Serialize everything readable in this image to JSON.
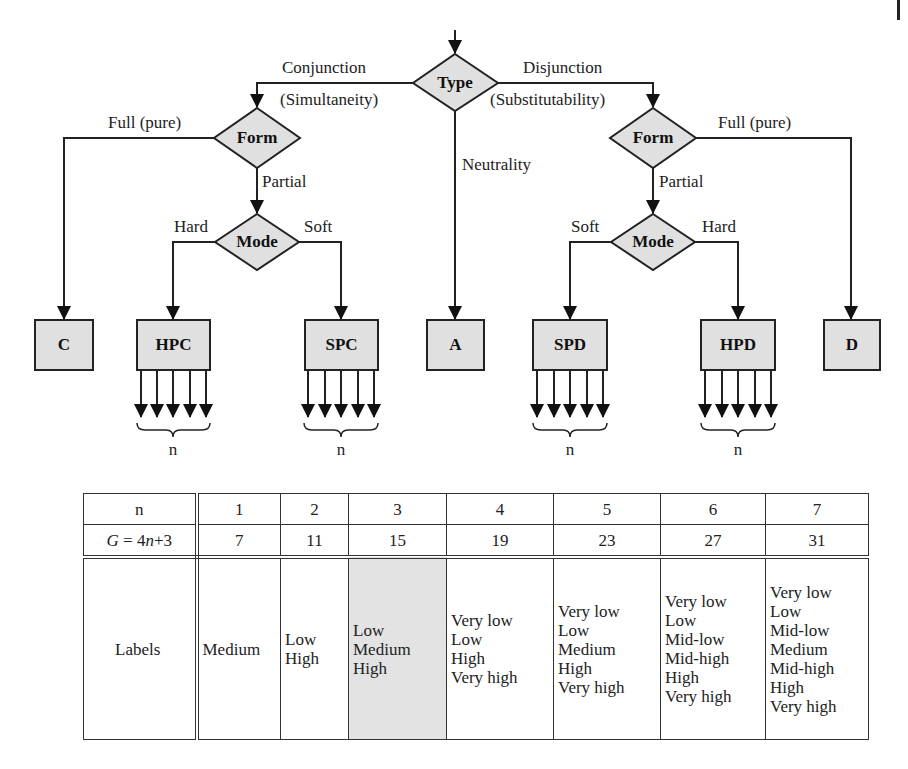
{
  "diagram": {
    "decisions": {
      "type": "Type",
      "form_left": "Form",
      "form_right": "Form",
      "mode_left": "Mode",
      "mode_right": "Mode"
    },
    "edges": {
      "conjunction": "Conjunction",
      "simultaneity": "(Simultaneity)",
      "disjunction": "Disjunction",
      "substitutability": "(Substitutability)",
      "neutrality": "Neutrality",
      "full_left": "Full (pure)",
      "full_right": "Full (pure)",
      "partial_left": "Partial",
      "partial_right": "Partial",
      "hard_left": "Hard",
      "soft_left": "Soft",
      "soft_right": "Soft",
      "hard_right": "Hard"
    },
    "outcomes": {
      "c": "C",
      "hpc": "HPC",
      "spc": "SPC",
      "a": "A",
      "spd": "SPD",
      "hpd": "HPD",
      "d": "D"
    },
    "brace_label": "n",
    "fill_color": "#e0e0e0",
    "stroke_color": "#222222"
  },
  "table": {
    "row_n": {
      "header": "n",
      "values": [
        "1",
        "2",
        "3",
        "4",
        "5",
        "6",
        "7"
      ]
    },
    "row_g": {
      "header_prefix": "G",
      "header_formula": " = 4",
      "header_var": "n",
      "header_suffix": "+3",
      "values": [
        "7",
        "11",
        "15",
        "19",
        "23",
        "27",
        "31"
      ]
    },
    "row_labels": {
      "header": "Labels",
      "values": [
        [
          "Medium"
        ],
        [
          "Low",
          "High"
        ],
        [
          "Low",
          "Medium",
          "High"
        ],
        [
          "Very low",
          "Low",
          "High",
          "Very high"
        ],
        [
          "Very low",
          "Low",
          "Medium",
          "High",
          "Very high"
        ],
        [
          "Very low",
          "Low",
          "Mid-low",
          "Mid-high",
          "High",
          "Very high"
        ],
        [
          "Very low",
          "Low",
          "Mid-low",
          "Medium",
          "Mid-high",
          "High",
          "Very high"
        ]
      ]
    },
    "highlighted_column_index": 2,
    "highlight_color": "#e3e3e3"
  }
}
